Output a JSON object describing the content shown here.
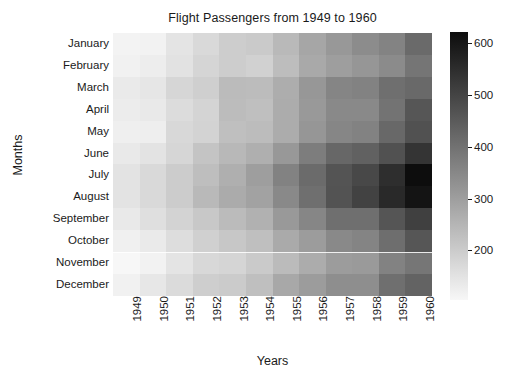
{
  "chart_data": {
    "type": "heatmap",
    "title": "Flight Passengers from 1949 to 1960",
    "xlabel": "Years",
    "ylabel": "Months",
    "colormap": "grayscale-reversed",
    "x_categories": [
      "1949",
      "1950",
      "1951",
      "1952",
      "1953",
      "1954",
      "1955",
      "1956",
      "1957",
      "1958",
      "1959",
      "1960"
    ],
    "y_categories": [
      "January",
      "February",
      "March",
      "April",
      "May",
      "June",
      "July",
      "August",
      "September",
      "October",
      "November",
      "December"
    ],
    "colorbar": {
      "ticks": [
        200,
        300,
        400,
        500,
        600
      ],
      "tick_labels": [
        "200",
        "300",
        "400",
        "500",
        "600"
      ],
      "vmin": 104,
      "vmax": 622,
      "position": "right"
    },
    "grid": false,
    "values": [
      [
        112,
        115,
        145,
        171,
        196,
        204,
        242,
        284,
        315,
        340,
        360,
        417
      ],
      [
        118,
        126,
        150,
        180,
        196,
        188,
        233,
        277,
        301,
        318,
        342,
        391
      ],
      [
        132,
        141,
        178,
        193,
        236,
        235,
        267,
        317,
        356,
        362,
        406,
        419
      ],
      [
        129,
        135,
        163,
        181,
        235,
        227,
        269,
        313,
        348,
        348,
        396,
        461
      ],
      [
        121,
        125,
        172,
        183,
        229,
        234,
        270,
        318,
        355,
        363,
        420,
        472
      ],
      [
        135,
        149,
        178,
        218,
        243,
        264,
        315,
        374,
        422,
        435,
        472,
        535
      ],
      [
        148,
        170,
        199,
        230,
        264,
        302,
        364,
        413,
        465,
        491,
        548,
        622
      ],
      [
        148,
        170,
        199,
        242,
        272,
        293,
        347,
        405,
        467,
        505,
        559,
        606
      ],
      [
        136,
        158,
        184,
        209,
        237,
        259,
        312,
        355,
        404,
        404,
        463,
        508
      ],
      [
        119,
        133,
        162,
        191,
        211,
        229,
        274,
        306,
        347,
        359,
        407,
        461
      ],
      [
        104,
        114,
        146,
        172,
        180,
        203,
        237,
        271,
        305,
        310,
        362,
        390
      ],
      [
        118,
        140,
        166,
        194,
        201,
        229,
        278,
        306,
        336,
        337,
        405,
        432
      ]
    ]
  }
}
